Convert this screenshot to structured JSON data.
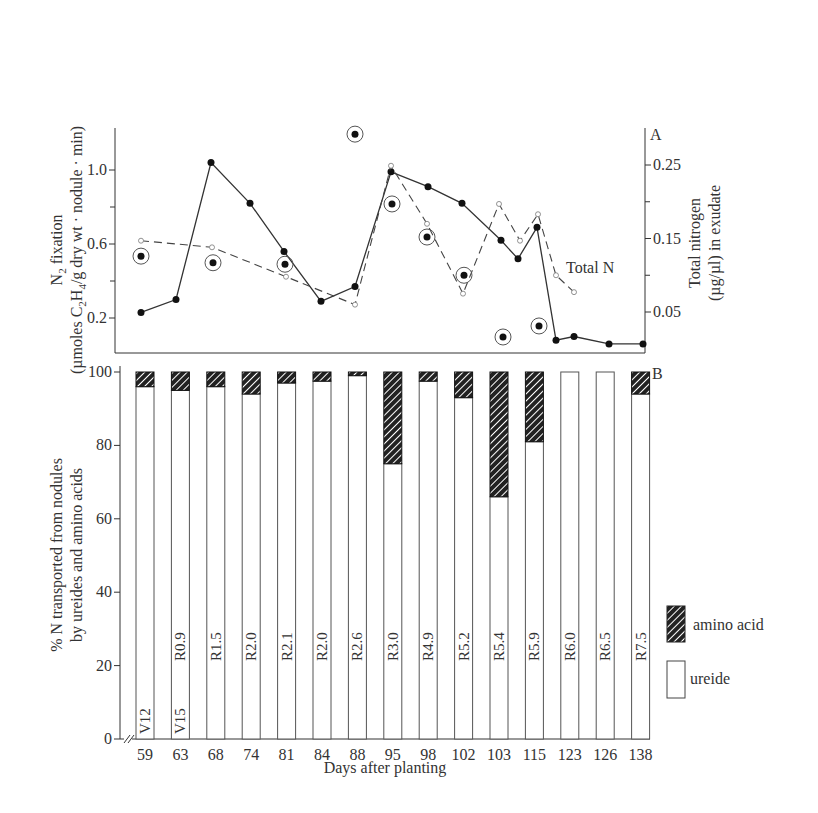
{
  "chart_data": [
    {
      "panel": "A",
      "type": "line",
      "ylabel_left_line1": "N2  fixation",
      "ylabel_left_line2": "(µmoles C2H4/g dry wt · nodule · min)",
      "ylabel_right_line1": "Total nitrogen",
      "ylabel_right_line2": "(µg/µl) in exudate",
      "yticks_left": [
        0.2,
        0.6,
        1.0
      ],
      "yticks_left_minor": [
        0.4,
        0.8
      ],
      "ylim_left": [
        0.0,
        1.2
      ],
      "yticks_right": [
        0.05,
        0.15,
        0.25
      ],
      "yticks_right_minor": [
        0.1,
        0.2
      ],
      "ylim_right": [
        0.0,
        0.29
      ],
      "grid": false,
      "annotation": "Total N",
      "series": [
        {
          "name": "N2 fixation",
          "axis": "left",
          "style": "solid line, filled dots",
          "x_px": [
            141,
            176,
            211,
            250,
            284,
            321,
            355,
            391,
            428,
            462,
            501,
            518,
            537,
            556,
            574,
            609,
            643
          ],
          "values": [
            0.23,
            0.3,
            1.04,
            0.82,
            0.56,
            0.29,
            0.37,
            0.99,
            0.91,
            0.82,
            0.62,
            0.52,
            0.69,
            0.08,
            0.1,
            0.06,
            0.06
          ]
        },
        {
          "name": "Total N",
          "axis": "right",
          "style": "dashed line, open circles",
          "x_px": [
            141,
            212,
            286,
            355,
            391,
            427,
            463,
            499,
            520,
            538,
            556,
            574
          ],
          "values": [
            0.147,
            0.138,
            0.098,
            0.06,
            0.249,
            0.17,
            0.075,
            0.197,
            0.147,
            0.183,
            0.1,
            0.077
          ]
        },
        {
          "name": "Circled points",
          "axis": "right",
          "style": "circled dots, unconnected",
          "x_px": [
            141,
            213,
            285,
            355,
            392,
            427,
            464,
            503,
            539
          ],
          "values": [
            0.126,
            0.117,
            0.115,
            0.292,
            0.197,
            0.152,
            0.1,
            0.016,
            0.031
          ]
        }
      ]
    },
    {
      "panel": "B",
      "type": "bar",
      "stacked": true,
      "xlabel": "Days after planting",
      "ylabel_line1": "% N transported from nodules",
      "ylabel_line2": "by ureides and amino acids",
      "ylim": [
        0,
        100
      ],
      "yticks": [
        0,
        20,
        40,
        60,
        80,
        100
      ],
      "categories": [
        "59",
        "63",
        "68",
        "74",
        "81",
        "84",
        "88",
        "95",
        "98",
        "102",
        "103",
        "115",
        "123",
        "126",
        "138"
      ],
      "stage_labels": [
        [
          "V12"
        ],
        [
          "V15",
          "R0.9"
        ],
        [
          "R1.5"
        ],
        [
          "R2.0"
        ],
        [
          "R2.1"
        ],
        [
          "R2.0"
        ],
        [
          "R2.6"
        ],
        [
          "R3.0"
        ],
        [
          "R4.9"
        ],
        [
          "R5.2"
        ],
        [
          "R5.4"
        ],
        [
          "R5.9"
        ],
        [
          "R6.0"
        ],
        [
          "R6.5"
        ],
        [
          "R7.5"
        ]
      ],
      "series": [
        {
          "name": "ureide",
          "values": [
            96,
            95,
            96,
            94,
            97,
            97.5,
            99,
            75,
            97.5,
            93,
            66,
            81,
            100,
            100,
            94
          ]
        },
        {
          "name": "amino acid",
          "values": [
            4,
            5,
            4,
            6,
            3,
            2.5,
            1,
            25,
            2.5,
            7,
            34,
            19,
            0,
            0,
            6
          ]
        }
      ],
      "legend": [
        {
          "label": "amino acid",
          "pattern": "hatched"
        },
        {
          "label": "ureide",
          "pattern": "open"
        }
      ],
      "legend_position": "right"
    }
  ],
  "labels": {
    "panel_a": "A",
    "panel_b": "B",
    "total_n": "Total N",
    "legend_amino": "amino acid",
    "legend_ureide": "ureide",
    "xlabel": "Days after planting"
  },
  "colors": {
    "ink": "#2a2a2a",
    "line": "#333333",
    "paper": "#ffffff"
  }
}
